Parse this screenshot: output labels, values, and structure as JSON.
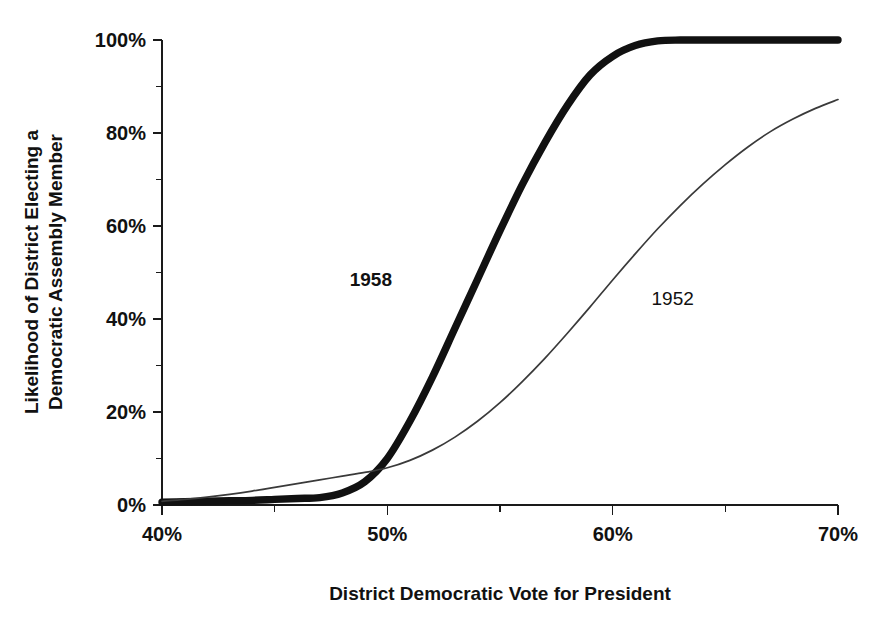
{
  "chart_data": {
    "type": "line",
    "title": "",
    "xlabel": "District Democratic Vote for President",
    "ylabel": "Likelihood of District Electing a Democratic Assembly Member",
    "ylabel_line1": "Likelihood of District Electing a",
    "ylabel_line2": "Democratic Assembly Member",
    "xlim": [
      40,
      70
    ],
    "ylim": [
      0,
      100
    ],
    "grid": false,
    "legend_position": "inline-annotation",
    "x_ticks_major": [
      40,
      50,
      60,
      70
    ],
    "x_ticks_minor": [
      45,
      55,
      65
    ],
    "x_tick_labels": [
      "40%",
      "50%",
      "60%",
      "70%"
    ],
    "y_ticks_major": [
      0,
      20,
      40,
      60,
      80,
      100
    ],
    "y_ticks_minor": [
      10,
      30,
      50,
      70,
      90
    ],
    "y_tick_labels": [
      "0%",
      "20%",
      "40%",
      "60%",
      "80%",
      "100%"
    ],
    "x": [
      40,
      41,
      42,
      43,
      44,
      45,
      46,
      47,
      48,
      49,
      50,
      51,
      52,
      53,
      54,
      55,
      56,
      57,
      58,
      59,
      60,
      61,
      62,
      63,
      64,
      65,
      66,
      67,
      68,
      69,
      70
    ],
    "series": [
      {
        "name": "1958",
        "label": "1958",
        "style": "thick",
        "color": "#111111",
        "label_x": 53.3,
        "label_y": 47,
        "values": [
          0.6,
          0.7,
          0.8,
          0.9,
          1.0,
          1.2,
          1.4,
          1.6,
          2.6,
          5.0,
          10.0,
          18.0,
          27.5,
          38.0,
          48.5,
          59.0,
          69.0,
          78.0,
          86.0,
          92.5,
          96.5,
          98.8,
          99.8,
          100.0,
          100.0,
          100.0,
          100.0,
          100.0,
          100.0,
          100.0,
          100.0
        ]
      },
      {
        "name": "1952",
        "label": "1952",
        "style": "thin",
        "color": "#3a3a3a",
        "label_x": 63.5,
        "label_y": 43,
        "values": [
          0.8,
          1.2,
          1.7,
          2.3,
          3.0,
          3.8,
          4.6,
          5.4,
          6.2,
          7.0,
          8.0,
          9.6,
          11.8,
          14.6,
          18.0,
          22.0,
          26.6,
          31.6,
          37.0,
          42.6,
          48.4,
          54.0,
          59.4,
          64.4,
          69.0,
          73.2,
          77.0,
          80.3,
          83.0,
          85.3,
          87.2
        ]
      }
    ]
  },
  "axes": {
    "x_title": "District Democratic Vote for President",
    "y_title_line1": "Likelihood of District Electing a",
    "y_title_line2": "Democratic Assembly Member"
  }
}
